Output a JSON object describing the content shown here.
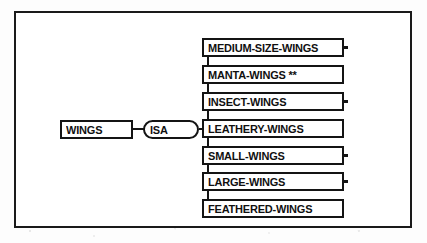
{
  "figure": {
    "type": "semantic-network",
    "root": {
      "id": "wings",
      "label": "WINGS",
      "shape": "rectangle"
    },
    "relation": {
      "id": "isa",
      "label": "ISA",
      "shape": "stadium"
    },
    "children": [
      {
        "id": "medium-size-wings",
        "label": "MEDIUM-SIZE-WINGS",
        "shape": "rectangle",
        "terminal_stub": true,
        "marker": ""
      },
      {
        "id": "manta-wings",
        "label": "MANTA-WINGS **",
        "shape": "rectangle",
        "terminal_stub": false,
        "marker": "**"
      },
      {
        "id": "insect-wings",
        "label": "INSECT-WINGS",
        "shape": "rectangle",
        "terminal_stub": true,
        "marker": ""
      },
      {
        "id": "leathery-wings",
        "label": "LEATHERY-WINGS",
        "shape": "rectangle",
        "terminal_stub": false,
        "marker": ""
      },
      {
        "id": "small-wings",
        "label": "SMALL-WINGS",
        "shape": "rectangle",
        "terminal_stub": true,
        "marker": ""
      },
      {
        "id": "large-wings",
        "label": "LARGE-WINGS",
        "shape": "rectangle",
        "terminal_stub": true,
        "marker": ""
      },
      {
        "id": "feathered-wings",
        "label": "FEATHERED-WINGS",
        "shape": "rectangle",
        "terminal_stub": false,
        "marker": ""
      }
    ],
    "colors": {
      "ink": "#141414",
      "frame": "#1a1a1a",
      "node_fill": "#ffffff",
      "paper": "#fdfdfd"
    }
  }
}
